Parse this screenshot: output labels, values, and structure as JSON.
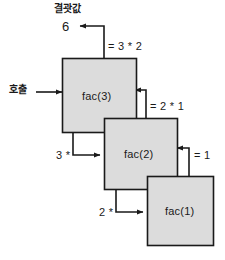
{
  "diagram": {
    "title_label": "결괏값",
    "result_value": "6",
    "call_label": "호출",
    "frames": [
      {
        "name": "fac-3",
        "label": "fac(3)"
      },
      {
        "name": "fac-2",
        "label": "fac(2)"
      },
      {
        "name": "fac-1",
        "label": "fac(1)"
      }
    ],
    "return_labels": [
      {
        "name": "return-expr-fac3",
        "text": "= 3 * 2"
      },
      {
        "name": "return-expr-fac2",
        "text": "= 2 * 1"
      },
      {
        "name": "return-expr-fac1",
        "text": "= 1"
      }
    ],
    "call_labels": [
      {
        "name": "call-multiplier-3",
        "text": "3 *"
      },
      {
        "name": "call-multiplier-2",
        "text": "2 *"
      }
    ],
    "colors": {
      "box_fill": "#dcdcdc",
      "box_stroke": "#1a1a1a",
      "arrow": "#1a1a1a",
      "text": "#1a1a1a",
      "background": "#ffffff"
    }
  }
}
